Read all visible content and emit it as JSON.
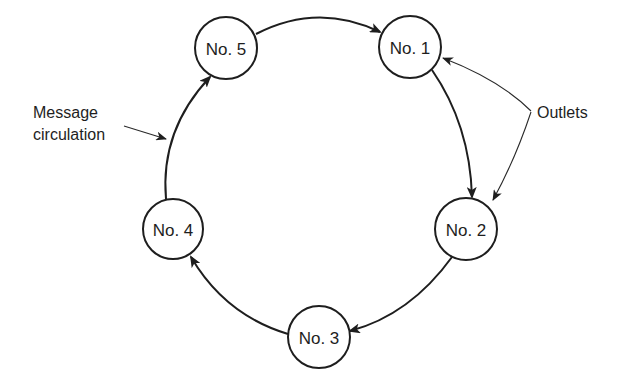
{
  "diagram": {
    "type": "ring-network",
    "colors": {
      "stroke": "#1e1e1e",
      "background": "#ffffff"
    },
    "nodes": [
      {
        "id": "n1",
        "label": "No. 1",
        "cx": 410,
        "cy": 47,
        "r": 31
      },
      {
        "id": "n2",
        "label": "No. 2",
        "cx": 466,
        "cy": 229,
        "r": 31
      },
      {
        "id": "n3",
        "label": "No. 3",
        "cx": 319,
        "cy": 337,
        "r": 31
      },
      {
        "id": "n4",
        "label": "No. 4",
        "cx": 173,
        "cy": 229,
        "r": 30
      },
      {
        "id": "n5",
        "label": "No. 5",
        "cx": 226,
        "cy": 48,
        "r": 31
      }
    ],
    "edges": [
      {
        "from": "No. 5",
        "to": "No. 1",
        "direction": "clockwise"
      },
      {
        "from": "No. 1",
        "to": "No. 2",
        "direction": "clockwise"
      },
      {
        "from": "No. 2",
        "to": "No. 3",
        "direction": "clockwise"
      },
      {
        "from": "No. 3",
        "to": "No. 4",
        "direction": "clockwise"
      },
      {
        "from": "No. 4",
        "to": "No. 5",
        "direction": "clockwise"
      }
    ],
    "annotations": {
      "message_circulation": {
        "line1": "Message",
        "line2": "circulation"
      },
      "outlets": {
        "label": "Outlets",
        "points_to": [
          "No. 1",
          "No. 2"
        ]
      }
    }
  }
}
